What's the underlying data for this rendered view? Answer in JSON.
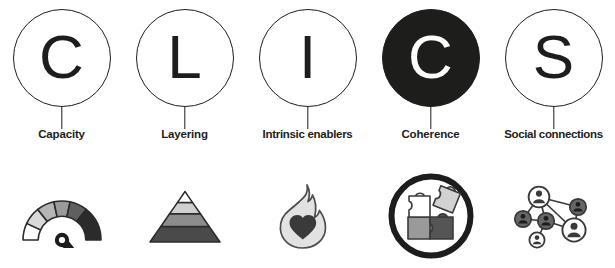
{
  "diagram": {
    "acronym": "CLICS",
    "columns": [
      {
        "letter": "C",
        "label": "Capacity",
        "letter_style": "outline",
        "icon_name": "gauge-icon"
      },
      {
        "letter": "L",
        "label": "Layering",
        "letter_style": "outline",
        "icon_name": "pyramid-icon"
      },
      {
        "letter": "I",
        "label": "Intrinsic enablers",
        "letter_style": "outline",
        "icon_name": "flame-heart-icon"
      },
      {
        "letter": "C",
        "label": "Coherence",
        "letter_style": "filled",
        "icon_name": "puzzle-pieces-icon"
      },
      {
        "letter": "S",
        "label": "Social connections",
        "letter_style": "outline",
        "icon_name": "network-people-icon"
      }
    ]
  },
  "colors": {
    "ink": "#1d1d1b",
    "background": "#ffffff",
    "gray_lightest": "#ffffff",
    "gray_light": "#d9d9d9",
    "gray_mid": "#9a9a9a",
    "gray_dark": "#585858",
    "gray_darkest": "#2b2b2b"
  }
}
